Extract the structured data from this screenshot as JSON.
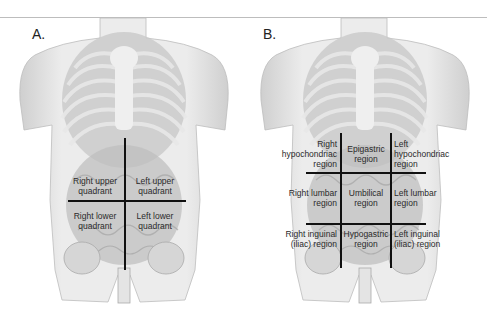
{
  "figure": {
    "panels": [
      {
        "id": "A",
        "label": "A.",
        "scheme": "four quadrants",
        "regions": [
          {
            "line1": "Right upper",
            "line2": "quadrant"
          },
          {
            "line1": "Left upper",
            "line2": "quadrant"
          },
          {
            "line1": "Right lower",
            "line2": "quadrant"
          },
          {
            "line1": "Left lower",
            "line2": "quadrant"
          }
        ]
      },
      {
        "id": "B",
        "label": "B.",
        "scheme": "nine regions",
        "regions": [
          {
            "line1": "Right",
            "line2": "hypochondriac",
            "line3": "region"
          },
          {
            "line1": "Epigastric",
            "line2": "region"
          },
          {
            "line1": "Left",
            "line2": "hypochondriac",
            "line3": "region"
          },
          {
            "line1": "Right lumbar",
            "line2": "region"
          },
          {
            "line1": "Umbilical",
            "line2": "region"
          },
          {
            "line1": "Left lumbar",
            "line2": "region"
          },
          {
            "line1": "Right inguinal",
            "line2": "(iliac) region"
          },
          {
            "line1": "Hypogastric",
            "line2": "region"
          },
          {
            "line1": "Left inguinal",
            "line2": "(iliac) region"
          }
        ]
      }
    ],
    "colors": {
      "skin": "#e4e4e4",
      "ribs": "#cfcfcf",
      "organs": "#b5b5b5",
      "divider_lines": "#111111"
    }
  }
}
